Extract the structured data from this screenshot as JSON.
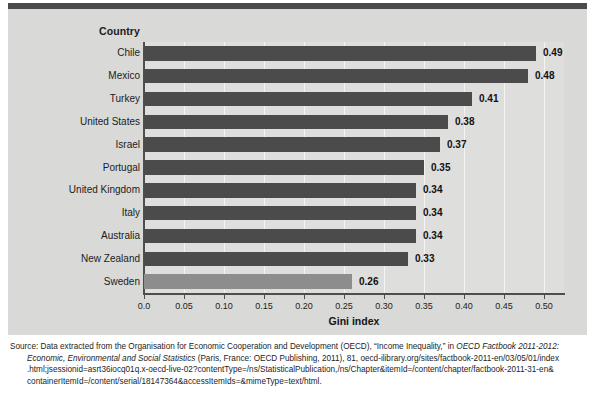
{
  "chart_data": {
    "type": "bar",
    "orientation": "horizontal",
    "title": "",
    "xlabel": "Gini index",
    "ylabel": "Country",
    "categories": [
      "Chile",
      "Mexico",
      "Turkey",
      "United States",
      "Israel",
      "Portugal",
      "United Kingdom",
      "Italy",
      "Australia",
      "New Zealand",
      "Sweden"
    ],
    "values": [
      0.49,
      0.48,
      0.41,
      0.38,
      0.37,
      0.35,
      0.34,
      0.34,
      0.34,
      0.33,
      0.26
    ],
    "value_labels": [
      "0.49",
      "0.48",
      "0.41",
      "0.38",
      "0.37",
      "0.35",
      "0.34",
      "0.34",
      "0.34",
      "0.33",
      "0.26"
    ],
    "highlighted_category": "Sweden",
    "xlim": [
      0.0,
      0.525
    ],
    "xticks": [
      0.0,
      0.05,
      0.1,
      0.15,
      0.2,
      0.25,
      0.3,
      0.35,
      0.4,
      0.45,
      0.5
    ],
    "xtick_labels": [
      "0.0",
      "0.05",
      "0.10",
      "0.15",
      "0.20",
      "0.25",
      "0.30",
      "0.35",
      "0.40",
      "0.45",
      "0.50"
    ],
    "grid": true,
    "legend": "none",
    "colors": {
      "bar": "#4b4b4b",
      "bar_highlight": "#8d8d8d",
      "panel_background": "#d9d9d7",
      "plot_background": "#dededc",
      "gridline": "#f3f3f1",
      "axis": "#4e4e4e",
      "text": "#1c1c1c",
      "top_rule": "#4a4a4a"
    }
  },
  "axes": {
    "country_header": "Country",
    "x_axis_title": "Gini index"
  },
  "source": {
    "line1_a": "Source: Data extracted from the Organisation for Economic Cooperation and Development (OECD), “Income Inequality,” in ",
    "line1_i": "OECD Factbook 2011-2012:",
    "line2_i": "Economic, Environmental and Social Statistics",
    "line2_b": " (Paris, France: OECD Publishing, 2011), 81, oecd-ilibrary.org/sites/factbook-2011-en/03/05/01/index",
    "line3": ".html;jsessionid=asrt36iocq01q.x-oecd-live-02?contentType=/ns/StatisticalPublication,/ns/Chapter&itemId=/content/chapter/factbook-2011-31-en&",
    "line4": "containerItemId=/content/serial/18147364&accessItemIds=&mimeType=text/html."
  }
}
